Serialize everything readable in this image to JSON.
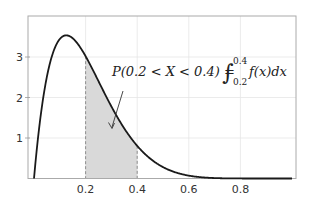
{
  "chart_data": {
    "type": "area",
    "title": "",
    "xlabel": "",
    "ylabel": "",
    "xlim": [
      0,
      1
    ],
    "ylim": [
      0,
      3.8
    ],
    "grid": true,
    "distribution": "Beta(2, 8) density, f(x) = 72 x (1 - x)^7",
    "x_ticks": [
      0.2,
      0.4,
      0.6,
      0.8
    ],
    "x_tick_labels": [
      "0.2",
      "0.4",
      "0.6",
      "0.8"
    ],
    "y_ticks": [
      1,
      2,
      3
    ],
    "y_tick_labels": [
      "1",
      "2",
      "3"
    ],
    "series": [
      {
        "name": "f(x)",
        "x": [
          0,
          0.02,
          0.05,
          0.08,
          0.1,
          0.125,
          0.15,
          0.2,
          0.25,
          0.3,
          0.35,
          0.4,
          0.5,
          0.6,
          0.7,
          0.8,
          0.9,
          1.0
        ],
        "values": [
          0,
          1.25,
          2.51,
          3.19,
          3.44,
          3.53,
          3.48,
          3.02,
          2.4,
          1.78,
          1.24,
          0.81,
          0.28,
          0.07,
          0.01,
          0.0,
          0.0,
          0
        ]
      }
    ],
    "shaded_region": {
      "from": 0.2,
      "to": 0.4,
      "color": "#d9d9d9"
    },
    "annotation": {
      "text_lhs": "P(0.2 < X < 0.4) =",
      "integral_upper": "0.4",
      "integral_lower": "0.2",
      "integrand": "f(x)dx",
      "arrow_to": [
        0.3,
        1.25
      ]
    },
    "colors": {
      "curve": "#1a1a1a",
      "grid": "#e6e6e6",
      "axis": "#999999",
      "fill": "#d9d9d9",
      "dash": "#777777"
    }
  }
}
